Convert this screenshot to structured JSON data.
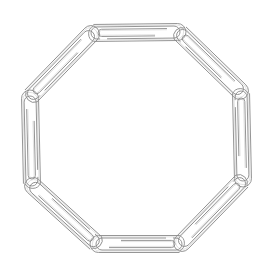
{
  "image": {
    "subject": "Eight paper clips linked in an octagon ring",
    "background": "#ffffff",
    "stroke_color": "#8a8a8a",
    "clip_count": 8,
    "joints": [
      [
        92,
        33
      ],
      [
        179,
        32
      ],
      [
        241,
        92
      ],
      [
        243,
        180
      ],
      [
        181,
        244
      ],
      [
        97,
        244
      ],
      [
        32,
        185
      ],
      [
        30,
        97
      ]
    ]
  }
}
